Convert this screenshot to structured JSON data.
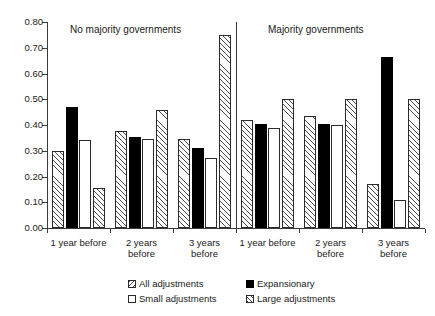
{
  "chart_data": {
    "type": "bar",
    "title": "",
    "xlabel": "",
    "ylabel": "",
    "ylim": [
      0.0,
      0.8
    ],
    "ytick_labels": [
      "0.00",
      "0.10",
      "0.20",
      "0.30",
      "0.40",
      "0.50",
      "0.60",
      "0.70",
      "0.80"
    ],
    "ytick_values": [
      0.0,
      0.1,
      0.2,
      0.3,
      0.4,
      0.5,
      0.6,
      0.7,
      0.8
    ],
    "grid": false,
    "legend_position": "bottom",
    "panels": [
      {
        "title": "No majority governments",
        "categories": [
          "1 year before",
          "2 years\nbefore",
          "3 years\nbefore"
        ],
        "series": [
          {
            "name": "All adjustments",
            "values": [
              0.3,
              0.375,
              0.345
            ]
          },
          {
            "name": "Expansionary",
            "values": [
              0.47,
              0.355,
              0.31
            ]
          },
          {
            "name": "Small adjustments",
            "values": [
              0.34,
              0.345,
              0.27
            ]
          },
          {
            "name": "Large adjustments",
            "values": [
              0.155,
              0.46,
              0.75
            ]
          }
        ]
      },
      {
        "title": "Majority governments",
        "categories": [
          "1 year before",
          "2 years\nbefore",
          "3 years\nbefore"
        ],
        "series": [
          {
            "name": "All adjustments",
            "values": [
              0.42,
              0.435,
              0.17
            ]
          },
          {
            "name": "Expansionary",
            "values": [
              0.405,
              0.405,
              0.665
            ]
          },
          {
            "name": "Small adjustments",
            "values": [
              0.39,
              0.4,
              0.11
            ]
          },
          {
            "name": "Large adjustments",
            "values": [
              0.5,
              0.5,
              0.5
            ]
          }
        ]
      }
    ],
    "legend": [
      {
        "label": "All adjustments",
        "pattern": "diagonal-hatch",
        "key": "all"
      },
      {
        "label": "Expansionary",
        "pattern": "solid-black",
        "key": "exp"
      },
      {
        "label": "Small adjustments",
        "pattern": "white-outline",
        "key": "small"
      },
      {
        "label": "Large adjustments",
        "pattern": "diagonal-hatch",
        "key": "large"
      }
    ]
  }
}
